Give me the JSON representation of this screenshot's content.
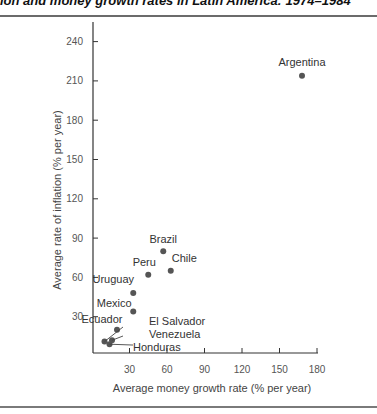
{
  "figure": {
    "title": "ion and money growth rates in Latin America: 1974–1984"
  },
  "chart_data": {
    "type": "scatter",
    "xlabel": "Average money growth rate (% per year)",
    "ylabel": "Average rate of inflation (% per year)",
    "xlim": [
      0,
      180
    ],
    "ylim": [
      0,
      250
    ],
    "xticks": [
      30,
      60,
      90,
      120,
      150,
      180
    ],
    "yticks": [
      30,
      60,
      90,
      120,
      150,
      180,
      210,
      240
    ],
    "grid": false,
    "points": [
      {
        "label": "Argentina",
        "x": 168,
        "y": 214
      },
      {
        "label": "Brazil",
        "x": 57,
        "y": 80
      },
      {
        "label": "Chile",
        "x": 63,
        "y": 65
      },
      {
        "label": "Peru",
        "x": 45,
        "y": 62
      },
      {
        "label": "Uruguay",
        "x": 33,
        "y": 48
      },
      {
        "label": "Mexico",
        "x": 33,
        "y": 34
      },
      {
        "label": "Ecuador",
        "x": 20,
        "y": 20
      },
      {
        "label": "El Salvador",
        "x": 10,
        "y": 11
      },
      {
        "label": "Venezuela",
        "x": 16,
        "y": 12
      },
      {
        "label": "Honduras",
        "x": 14,
        "y": 9
      }
    ]
  },
  "colors": {
    "dot": "#555555",
    "axis": "#333333"
  }
}
